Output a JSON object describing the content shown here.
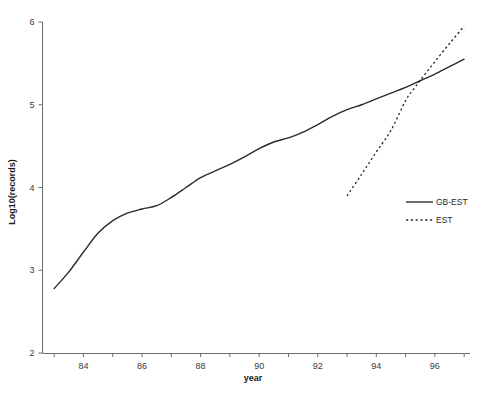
{
  "chart_data": {
    "type": "line",
    "title": "",
    "xlabel": "year",
    "ylabel": "Log10(records)",
    "xlim": [
      82.6,
      97.2
    ],
    "ylim": [
      2,
      6
    ],
    "grid": false,
    "legend_position": "center-right",
    "x_tick_labels": [
      "84",
      "86",
      "88",
      "90",
      "92",
      "94",
      "96"
    ],
    "x_tick_values": [
      84,
      86,
      88,
      90,
      92,
      94,
      96
    ],
    "x_minor_tick_values": [
      83,
      84,
      85,
      86,
      87,
      88,
      89,
      90,
      91,
      92,
      93,
      94,
      95,
      96,
      97
    ],
    "y_tick_labels": [
      "2",
      "3",
      "4",
      "5",
      "6"
    ],
    "y_tick_values": [
      2,
      3,
      4,
      5,
      6
    ],
    "series": [
      {
        "name": "GB-EST",
        "style": "solid",
        "color": "#2b2b2b",
        "x": [
          83.0,
          83.5,
          84.0,
          84.5,
          85.0,
          85.5,
          86.0,
          86.5,
          87.0,
          87.5,
          88.0,
          88.5,
          89.0,
          89.5,
          90.0,
          90.5,
          91.0,
          91.5,
          92.0,
          92.5,
          93.0,
          93.5,
          94.0,
          94.5,
          95.0,
          95.5,
          96.0,
          96.5,
          97.0
        ],
        "y": [
          2.78,
          2.98,
          3.22,
          3.45,
          3.6,
          3.69,
          3.74,
          3.78,
          3.88,
          4.0,
          4.12,
          4.2,
          4.28,
          4.37,
          4.47,
          4.55,
          4.6,
          4.67,
          4.76,
          4.86,
          4.94,
          5.0,
          5.07,
          5.14,
          5.21,
          5.29,
          5.37,
          5.46,
          5.55
        ]
      },
      {
        "name": "EST",
        "style": "dashed",
        "color": "#2b2b2b",
        "x": [
          93.0,
          93.5,
          94.0,
          94.5,
          95.0,
          95.3,
          95.6,
          96.0,
          96.5,
          97.0
        ],
        "y": [
          3.9,
          4.16,
          4.43,
          4.69,
          5.05,
          5.2,
          5.34,
          5.52,
          5.74,
          5.95
        ]
      }
    ]
  },
  "legend": {
    "items": [
      {
        "label": "GB-EST",
        "style": "solid"
      },
      {
        "label": "EST",
        "style": "dashed"
      }
    ]
  },
  "axes": {
    "x_title": "year",
    "y_title": "Log10(records)"
  }
}
